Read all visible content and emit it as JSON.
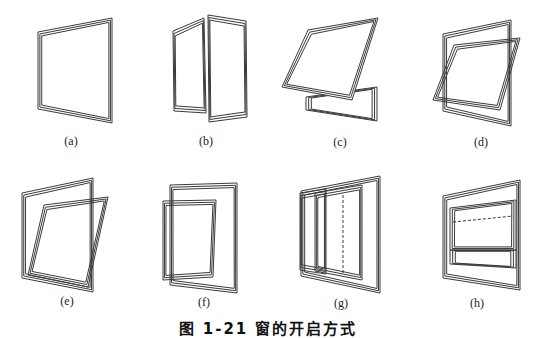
{
  "figure": {
    "top_clipped_text": "······",
    "caption": "图 1-21 窗的开启方式",
    "stroke_color": "#3a3a3a",
    "panels": [
      {
        "id": "a",
        "label": "(a)",
        "type": "fixed"
      },
      {
        "id": "b",
        "label": "(b)",
        "type": "side-hung-casement"
      },
      {
        "id": "c",
        "label": "(c)",
        "type": "top-hung"
      },
      {
        "id": "d",
        "label": "(d)",
        "type": "horizontal-pivot"
      },
      {
        "id": "e",
        "label": "(e)",
        "type": "vertical-pivot-offset"
      },
      {
        "id": "f",
        "label": "(f)",
        "type": "vertical-pivot-center"
      },
      {
        "id": "g",
        "label": "(g)",
        "type": "horizontal-sliding"
      },
      {
        "id": "h",
        "label": "(h)",
        "type": "vertical-sliding"
      }
    ]
  }
}
